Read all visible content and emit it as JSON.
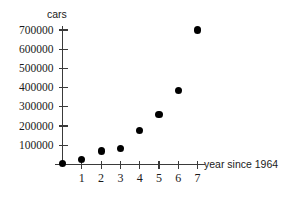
{
  "chart_data": {
    "type": "scatter",
    "title": "",
    "xlabel": "year since 1964",
    "ylabel": "cars",
    "x": [
      0,
      1,
      2,
      3,
      4,
      5,
      6,
      7
    ],
    "values": [
      5000,
      25000,
      70000,
      85000,
      175000,
      260000,
      385000,
      700000
    ],
    "xlim": [
      0,
      7.6
    ],
    "ylim": [
      0,
      740000
    ],
    "xticks": [
      1,
      2,
      3,
      4,
      5,
      6,
      7
    ],
    "xtick_labels": [
      "1",
      "2",
      "3",
      "4",
      "5",
      "6",
      "7"
    ],
    "yticks": [
      100000,
      200000,
      300000,
      400000,
      500000,
      600000,
      700000
    ],
    "ytick_labels": [
      "100000",
      "200000",
      "300000",
      "400000",
      "500000",
      "600000",
      "700000"
    ],
    "grid": false,
    "legend": null,
    "marker": "filled-circle",
    "marker_color": "#000000",
    "axis_color": "#3a3a3a"
  }
}
